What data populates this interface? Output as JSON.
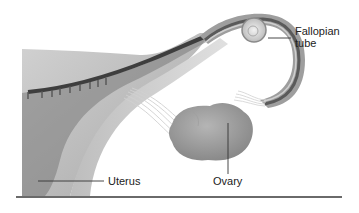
{
  "figure": {
    "labels": {
      "fallopian_tube_line1": "Fallopian",
      "fallopian_tube_line2": "tube",
      "uterus": "Uterus",
      "ovary": "Ovary"
    }
  },
  "colors": {
    "background": "#ffffff",
    "tissue_light": "#c4c4c4",
    "tissue_mid": "#9a9a9a",
    "tissue_dark": "#4a4a4a",
    "leader_line": "#333333",
    "rule": "#6a6a6a"
  }
}
